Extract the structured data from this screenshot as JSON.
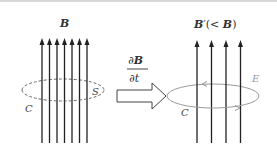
{
  "left_panel": {
    "field_label": "B",
    "surface_label": "S",
    "curve_label": "C",
    "num_field_lines": 7
  },
  "transition": {
    "numerator": "∂B",
    "denominator": "∂t"
  },
  "right_panel": {
    "field_label": "B′(< B)",
    "field_label_main": "B",
    "field_label_rest": "′(< ",
    "field_label_b": "B",
    "field_label_close": ")",
    "electric_label": "E",
    "curve_label": "C",
    "num_field_lines": 4
  },
  "colors": {
    "field_line": "#222222",
    "loop_left": "#555555",
    "loop_right": "#9a9a9a",
    "text": "#333333"
  }
}
